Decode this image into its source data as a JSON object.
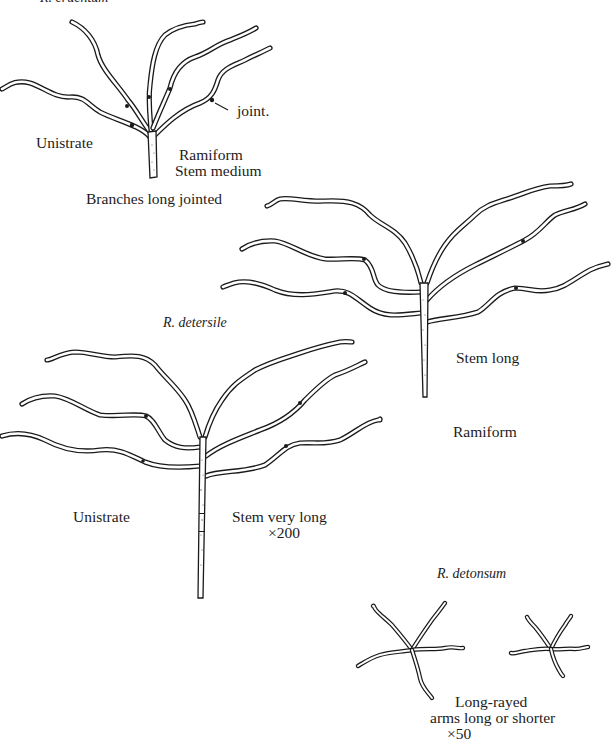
{
  "figure": {
    "colors": {
      "ink": "#1a1a1a",
      "background": "#ffffff"
    },
    "specimens": [
      {
        "id": "cruentum",
        "name": "R. cruentum",
        "annotations": {
          "left": "Unistrate",
          "right_line1": "Ramiform",
          "right_line2": "Stem medium",
          "bottom": "Branches long jointed",
          "joint_pointer": "joint."
        }
      },
      {
        "id": "unnamed-middle",
        "annotations": {
          "stem": "Stem long",
          "form": "Ramiform"
        }
      },
      {
        "id": "detersile",
        "name": "R. detersile",
        "annotations": {
          "left": "Unistrate",
          "right_line1": "Stem very long",
          "magnification": "×200"
        }
      },
      {
        "id": "detonsum",
        "name": "R. detonsum",
        "annotations": {
          "line1": "Long-rayed",
          "line2": "arms long or shorter",
          "magnification": "×50"
        }
      }
    ]
  }
}
